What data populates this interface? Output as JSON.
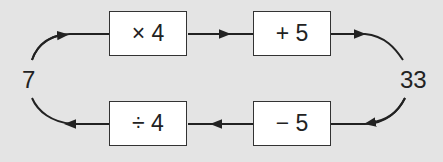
{
  "diagram": {
    "type": "function-machine-loop",
    "input": "7",
    "output": "33",
    "forward": [
      {
        "label": "× 4"
      },
      {
        "label": "+ 5"
      }
    ],
    "inverse": [
      {
        "label": "− 5"
      },
      {
        "label": "÷ 4"
      }
    ]
  }
}
